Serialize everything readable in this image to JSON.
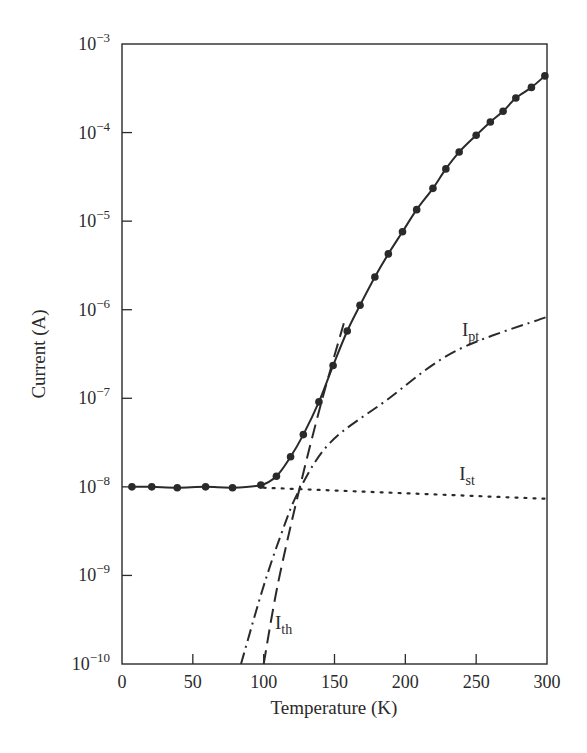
{
  "chart_data": {
    "type": "line",
    "title": "",
    "xlabel": "Temperature (K)",
    "ylabel": "Current (A)",
    "xlim": [
      0,
      300
    ],
    "ylim_log10": [
      -10,
      -3
    ],
    "yscale": "log",
    "grid": false,
    "legend": "inline labels",
    "x_ticks": [
      0,
      50,
      100,
      150,
      200,
      250,
      300
    ],
    "y_ticks_exponent": [
      -10,
      -9,
      -8,
      -7,
      -6,
      -5,
      -4,
      -3
    ],
    "y_tick_base": "10",
    "series": [
      {
        "name": "Measured current (total)",
        "style": "solid-with-markers",
        "x": [
          7,
          21,
          39,
          59,
          78,
          98,
          109,
          119,
          128,
          139,
          149,
          159,
          168,
          178.5,
          188,
          198,
          208,
          219.5,
          228.6,
          238,
          250,
          260,
          269,
          278,
          289,
          298.5
        ],
        "log10_y": [
          -8.0,
          -8.0,
          -8.01,
          -8.0,
          -8.01,
          -7.98,
          -7.88,
          -7.66,
          -7.41,
          -7.04,
          -6.63,
          -6.24,
          -5.95,
          -5.63,
          -5.37,
          -5.12,
          -4.87,
          -4.63,
          -4.41,
          -4.22,
          -4.03,
          -3.88,
          -3.76,
          -3.61,
          -3.49,
          -3.36
        ]
      },
      {
        "name": "I_th",
        "label_main": "I",
        "label_sub": "th",
        "style": "dashed",
        "x": [
          100,
          110,
          125,
          141,
          157
        ],
        "log10_y": [
          -10.0,
          -9.1,
          -8.04,
          -7.03,
          -6.13
        ]
      },
      {
        "name": "I_pt",
        "label_main": "I",
        "label_sub": "pt",
        "style": "dash-dot",
        "x": [
          84,
          99,
          112,
          125,
          147,
          186,
          235,
          300
        ],
        "log10_y": [
          -10.0,
          -9.17,
          -8.55,
          -8.04,
          -7.5,
          -7.03,
          -6.47,
          -6.08
        ]
      },
      {
        "name": "I_st",
        "label_main": "I",
        "label_sub": "st",
        "style": "dotted",
        "x": [
          100,
          300
        ],
        "log10_y": [
          -8.01,
          -8.135
        ]
      }
    ],
    "annotations": [
      {
        "text": "I_pt",
        "x": 240,
        "log10_y": -6.3
      },
      {
        "text": "I_st",
        "x": 238,
        "log10_y": -7.92
      },
      {
        "text": "I_th",
        "x": 108,
        "log10_y": -9.6
      }
    ]
  }
}
